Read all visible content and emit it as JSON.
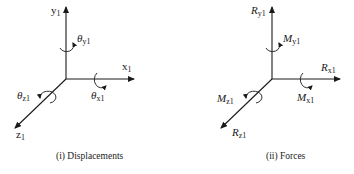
{
  "panels": [
    {
      "id": "displacements",
      "caption": "(i) Displacements",
      "labels": {
        "y": {
          "sym": "y",
          "sub": "1"
        },
        "x": {
          "sym": "x",
          "sub": "1"
        },
        "z": {
          "sym": "z",
          "sub": "1"
        },
        "rot_y": {
          "sym": "θ",
          "sub": "y1"
        },
        "rot_x": {
          "sym": "θ",
          "sub": "x1"
        },
        "rot_z": {
          "sym": "θ",
          "sub": "z1"
        }
      }
    },
    {
      "id": "forces",
      "caption": "(ii) Forces",
      "labels": {
        "y": {
          "sym": "R",
          "sub": "y1"
        },
        "x": {
          "sym": "R",
          "sub": "x1"
        },
        "z": {
          "sym": "R",
          "sub": "z1"
        },
        "rot_y": {
          "sym": "M",
          "sub": "y1"
        },
        "rot_x": {
          "sym": "M",
          "sub": "x1"
        },
        "rot_z": {
          "sym": "M",
          "sub": "z1"
        }
      }
    }
  ],
  "colors": {
    "stroke": "#1a1a1a",
    "background": "#ffffff"
  }
}
